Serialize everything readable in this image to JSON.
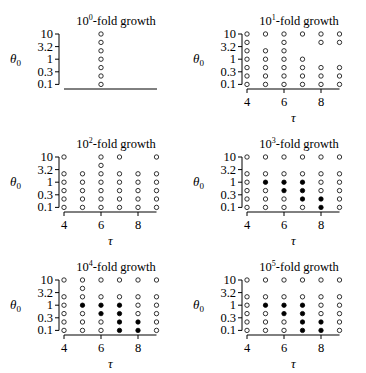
{
  "figure": {
    "width": 366,
    "height": 373,
    "colors": {
      "ink": "#000000",
      "background": "#ffffff",
      "open_marker_fill": "#ffffff",
      "filled_marker_fill": "#000000"
    }
  },
  "chart_data": [
    {
      "type": "scatter",
      "title": "10^0-fold growth",
      "title_base": "10",
      "title_exp": "0",
      "title_rest": "-fold growth",
      "xlabel": "τ",
      "ylabel": "θ0",
      "y_ticks": [
        "10",
        "3.2",
        "1",
        "0.3",
        "0.1"
      ],
      "x_ticks": [],
      "x_range": [
        4,
        9
      ],
      "row_values": [
        10,
        4.6,
        2.2,
        1,
        0.46,
        0.22,
        0.1
      ],
      "grid": false,
      "points": [
        {
          "tau": 6,
          "row": 0,
          "filled": false
        },
        {
          "tau": 6,
          "row": 1,
          "filled": false
        },
        {
          "tau": 6,
          "row": 2,
          "filled": false
        },
        {
          "tau": 6,
          "row": 3,
          "filled": false
        },
        {
          "tau": 6,
          "row": 4,
          "filled": false
        },
        {
          "tau": 6,
          "row": 5,
          "filled": false
        },
        {
          "tau": 6,
          "row": 6,
          "filled": false
        }
      ]
    },
    {
      "type": "scatter",
      "title": "10^1-fold growth",
      "title_base": "10",
      "title_exp": "1",
      "title_rest": "-fold growth",
      "xlabel": "τ",
      "ylabel": "θ0",
      "y_ticks": [
        "10",
        "3.2",
        "1",
        "0.3",
        "0.1"
      ],
      "x_ticks": [
        "4",
        "6",
        "8"
      ],
      "x_range": [
        4,
        9
      ],
      "row_values": [
        10,
        4.6,
        2.2,
        1,
        0.46,
        0.22,
        0.1
      ],
      "grid": false,
      "rows": [
        {
          "row": 0,
          "open": [
            4,
            5,
            6,
            7,
            8,
            9
          ],
          "filled": []
        },
        {
          "row": 1,
          "open": [
            4,
            6,
            8,
            9
          ],
          "filled": []
        },
        {
          "row": 2,
          "open": [
            4,
            5,
            6
          ],
          "filled": []
        },
        {
          "row": 3,
          "open": [
            4,
            5,
            6,
            7
          ],
          "filled": []
        },
        {
          "row": 4,
          "open": [
            4,
            5,
            6,
            7,
            8,
            9
          ],
          "filled": []
        },
        {
          "row": 5,
          "open": [
            4,
            5,
            6,
            7,
            8,
            9
          ],
          "filled": []
        },
        {
          "row": 6,
          "open": [
            4,
            5,
            6,
            7,
            8,
            9
          ],
          "filled": []
        }
      ]
    },
    {
      "type": "scatter",
      "title": "10^2-fold growth",
      "title_base": "10",
      "title_exp": "2",
      "title_rest": "-fold growth",
      "xlabel": "τ",
      "ylabel": "θ0",
      "y_ticks": [
        "10",
        "3.2",
        "1",
        "0.3",
        "0.1"
      ],
      "x_ticks": [
        "4",
        "6",
        "8"
      ],
      "x_range": [
        4,
        9
      ],
      "row_values": [
        10,
        4.6,
        2.2,
        1,
        0.46,
        0.22,
        0.1
      ],
      "grid": false,
      "rows": [
        {
          "row": 0,
          "open": [
            4,
            6,
            7,
            9
          ],
          "filled": []
        },
        {
          "row": 1,
          "open": [
            6
          ],
          "filled": []
        },
        {
          "row": 2,
          "open": [
            4,
            5,
            6,
            7,
            8,
            9
          ],
          "filled": []
        },
        {
          "row": 3,
          "open": [
            4,
            5,
            6,
            7,
            8,
            9
          ],
          "filled": []
        },
        {
          "row": 4,
          "open": [
            4,
            5,
            6,
            7,
            8,
            9
          ],
          "filled": []
        },
        {
          "row": 5,
          "open": [
            4,
            5,
            6,
            7,
            8,
            9
          ],
          "filled": []
        },
        {
          "row": 6,
          "open": [
            4,
            5,
            6,
            7,
            8,
            9
          ],
          "filled": []
        }
      ]
    },
    {
      "type": "scatter",
      "title": "10^3-fold growth",
      "title_base": "10",
      "title_exp": "3",
      "title_rest": "-fold growth",
      "xlabel": "τ",
      "ylabel": "θ0",
      "y_ticks": [
        "10",
        "3.2",
        "1",
        "0.3",
        "0.1"
      ],
      "x_ticks": [
        "4",
        "6",
        "8"
      ],
      "x_range": [
        4,
        9
      ],
      "row_values": [
        10,
        4.6,
        2.2,
        1,
        0.46,
        0.22,
        0.1
      ],
      "grid": false,
      "rows": [
        {
          "row": 0,
          "open": [
            4,
            5,
            6,
            7,
            8,
            9
          ],
          "filled": []
        },
        {
          "row": 2,
          "open": [
            4,
            5,
            6,
            7,
            8,
            9
          ],
          "filled": []
        },
        {
          "row": 3,
          "open": [
            4,
            8,
            9
          ],
          "filled": [
            5,
            6,
            7
          ]
        },
        {
          "row": 4,
          "open": [
            4,
            5,
            8,
            9
          ],
          "filled": [
            6,
            7
          ]
        },
        {
          "row": 5,
          "open": [
            4,
            5,
            6,
            9
          ],
          "filled": [
            7,
            8
          ]
        },
        {
          "row": 6,
          "open": [
            4,
            5,
            6,
            7,
            9
          ],
          "filled": [
            8
          ]
        }
      ]
    },
    {
      "type": "scatter",
      "title": "10^4-fold growth",
      "title_base": "10",
      "title_exp": "4",
      "title_rest": "-fold growth",
      "xlabel": "τ",
      "ylabel": "θ0",
      "y_ticks": [
        "10",
        "3.2",
        "1",
        "0.3",
        "0.1"
      ],
      "x_ticks": [
        "4",
        "6",
        "8"
      ],
      "x_range": [
        4,
        9
      ],
      "row_values": [
        10,
        4.6,
        2.2,
        1,
        0.46,
        0.22,
        0.1
      ],
      "grid": false,
      "rows": [
        {
          "row": 0,
          "open": [
            4,
            5,
            6,
            7,
            8,
            9
          ],
          "filled": []
        },
        {
          "row": 1,
          "open": [
            5
          ],
          "filled": []
        },
        {
          "row": 2,
          "open": [
            4,
            5,
            6,
            7,
            8,
            9
          ],
          "filled": []
        },
        {
          "row": 3,
          "open": [
            4,
            8,
            9
          ],
          "filled": [
            5,
            6,
            7
          ]
        },
        {
          "row": 4,
          "open": [
            4,
            5,
            8,
            9
          ],
          "filled": [
            6,
            7
          ]
        },
        {
          "row": 5,
          "open": [
            4,
            5,
            6,
            9
          ],
          "filled": [
            7,
            8
          ]
        },
        {
          "row": 6,
          "open": [
            4,
            5,
            6,
            9
          ],
          "filled": [
            7,
            8
          ]
        }
      ]
    },
    {
      "type": "scatter",
      "title": "10^5-fold growth",
      "title_base": "10",
      "title_exp": "5",
      "title_rest": "-fold growth",
      "xlabel": "τ",
      "ylabel": "θ0",
      "y_ticks": [
        "10",
        "3.2",
        "1",
        "0.3",
        "0.1"
      ],
      "x_ticks": [
        "4",
        "6",
        "8"
      ],
      "x_range": [
        4,
        9
      ],
      "row_values": [
        10,
        4.6,
        2.2,
        1,
        0.46,
        0.22,
        0.1
      ],
      "grid": false,
      "rows": [
        {
          "row": 0,
          "open": [
            4,
            5,
            6,
            7,
            8,
            9
          ],
          "filled": []
        },
        {
          "row": 2,
          "open": [
            4,
            5,
            6,
            7,
            8,
            9
          ],
          "filled": []
        },
        {
          "row": 3,
          "open": [
            4,
            8,
            9
          ],
          "filled": [
            5,
            6,
            7
          ]
        },
        {
          "row": 4,
          "open": [
            4,
            5,
            8,
            9
          ],
          "filled": [
            6,
            7
          ]
        },
        {
          "row": 5,
          "open": [
            4,
            5,
            6,
            9
          ],
          "filled": [
            7,
            8
          ]
        },
        {
          "row": 6,
          "open": [
            4,
            5,
            6,
            9
          ],
          "filled": [
            7,
            8
          ]
        }
      ]
    }
  ],
  "layout": {
    "panels": [
      {
        "ox": 0,
        "oy": 0
      },
      {
        "ox": 183,
        "oy": 0
      },
      {
        "ox": 0,
        "oy": 123
      },
      {
        "ox": 183,
        "oy": 123
      },
      {
        "ox": 0,
        "oy": 246
      },
      {
        "ox": 183,
        "oy": 246
      }
    ]
  }
}
